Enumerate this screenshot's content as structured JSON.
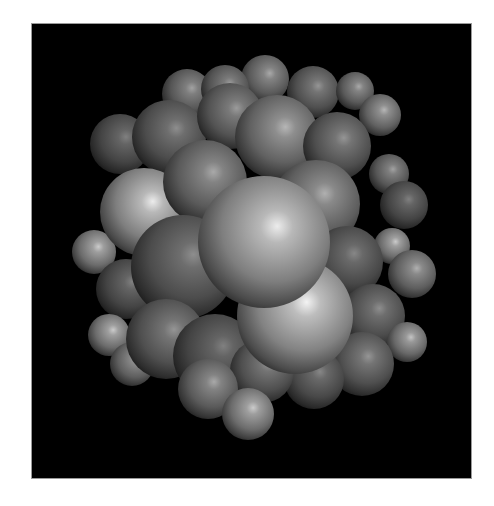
{
  "image": {
    "title": "Sphere cluster rendering",
    "background": "#000000",
    "page_background": "#ffffff",
    "frame_border": "#9a9a9a",
    "light_direction": "upper-right",
    "description": "Grayscale ray-traced cluster of shaded spheres packed together on a black background"
  },
  "spheres": [
    {
      "cx": 155,
      "cy": 70,
      "r": 25,
      "shade": 120
    },
    {
      "cx": 233,
      "cy": 55,
      "r": 24,
      "shade": 125
    },
    {
      "cx": 281,
      "cy": 68,
      "r": 26,
      "shade": 110
    },
    {
      "cx": 323,
      "cy": 67,
      "r": 19,
      "shade": 125
    },
    {
      "cx": 348,
      "cy": 91,
      "r": 21,
      "shade": 135
    },
    {
      "cx": 88,
      "cy": 120,
      "r": 30,
      "shade": 95
    },
    {
      "cx": 193,
      "cy": 65,
      "r": 24,
      "shade": 115
    },
    {
      "cx": 137,
      "cy": 113,
      "r": 37,
      "shade": 105
    },
    {
      "cx": 198,
      "cy": 92,
      "r": 33,
      "shade": 115
    },
    {
      "cx": 245,
      "cy": 113,
      "r": 42,
      "shade": 135
    },
    {
      "cx": 305,
      "cy": 122,
      "r": 34,
      "shade": 110
    },
    {
      "cx": 357,
      "cy": 150,
      "r": 20,
      "shade": 120
    },
    {
      "cx": 372,
      "cy": 181,
      "r": 24,
      "shade": 95
    },
    {
      "cx": 62,
      "cy": 228,
      "r": 22,
      "shade": 150
    },
    {
      "cx": 112,
      "cy": 188,
      "r": 44,
      "shade": 175
    },
    {
      "cx": 173,
      "cy": 158,
      "r": 42,
      "shade": 125
    },
    {
      "cx": 284,
      "cy": 180,
      "r": 44,
      "shade": 130
    },
    {
      "cx": 360,
      "cy": 222,
      "r": 18,
      "shade": 150
    },
    {
      "cx": 380,
      "cy": 250,
      "r": 24,
      "shade": 130
    },
    {
      "cx": 315,
      "cy": 238,
      "r": 36,
      "shade": 100
    },
    {
      "cx": 94,
      "cy": 265,
      "r": 30,
      "shade": 95
    },
    {
      "cx": 151,
      "cy": 243,
      "r": 52,
      "shade": 105
    },
    {
      "cx": 77,
      "cy": 311,
      "r": 21,
      "shade": 150
    },
    {
      "cx": 100,
      "cy": 340,
      "r": 22,
      "shade": 130
    },
    {
      "cx": 341,
      "cy": 292,
      "r": 32,
      "shade": 105
    },
    {
      "cx": 375,
      "cy": 318,
      "r": 20,
      "shade": 145
    },
    {
      "cx": 134,
      "cy": 315,
      "r": 40,
      "shade": 110
    },
    {
      "cx": 183,
      "cy": 332,
      "r": 42,
      "shade": 95
    },
    {
      "cx": 330,
      "cy": 340,
      "r": 32,
      "shade": 110
    },
    {
      "cx": 282,
      "cy": 355,
      "r": 30,
      "shade": 100
    },
    {
      "cx": 230,
      "cy": 347,
      "r": 32,
      "shade": 110
    },
    {
      "cx": 176,
      "cy": 365,
      "r": 30,
      "shade": 125
    },
    {
      "cx": 216,
      "cy": 390,
      "r": 26,
      "shade": 150
    },
    {
      "cx": 263,
      "cy": 292,
      "r": 58,
      "shade": 180
    },
    {
      "cx": 232,
      "cy": 218,
      "r": 66,
      "shade": 175
    }
  ]
}
